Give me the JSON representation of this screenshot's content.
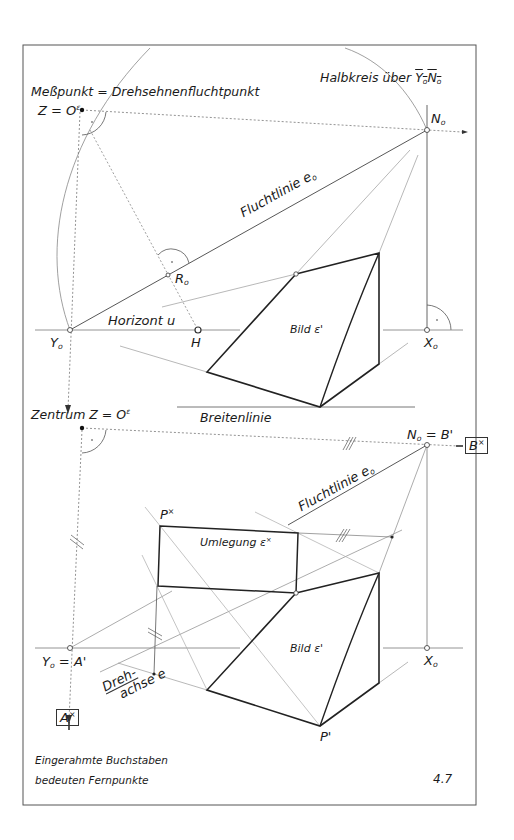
{
  "figure": {
    "number": "4.7",
    "caption_lines": [
      "Eingerahmte Buchstaben",
      "bedeuten Fernpunkte"
    ]
  },
  "top": {
    "title_left": "Meßpunkt = Drehsehnenfluchtpunkt",
    "title_right_prefix": "Halbkreis über ",
    "title_right_segment": "Y",
    "title_right_segment_sub": "o",
    "title_right_segment2": "N",
    "title_right_segment2_sub": "o",
    "z_label": "Z = O",
    "z_sup": "ε",
    "n0": "N",
    "n0_sub": "o",
    "fluchtlinie": "Fluchtlinie e",
    "fluchtlinie_sub": "o",
    "r0": "R",
    "r0_sub": "o",
    "horizont": "Horizont u",
    "h": "H",
    "y0": "Y",
    "y0_sub": "o",
    "x0": "X",
    "x0_sub": "o",
    "bild": "Bild ε'",
    "breitenlinie": "Breitenlinie"
  },
  "bottom": {
    "zentrum": "Zentrum  Z = O",
    "zentrum_sup": "ε",
    "n0": "N",
    "n0_sub": "o",
    "n0_eq": " = B'",
    "b_star": "B",
    "b_star_sup": "×",
    "fluchtlinie": "Fluchtlinie e",
    "fluchtlinie_sub": "o",
    "p_star": "P",
    "p_star_sup": "×",
    "umlegung": "Umlegung ε",
    "umlegung_sup": "×",
    "y0": "Y",
    "y0_sub": "o",
    "y0_eq": " = A'",
    "a_star": "A",
    "a_star_sup": "×",
    "dreh1": "Dreh-",
    "dreh2": "achse e",
    "bild": "Bild ε'",
    "x0": "X",
    "x0_sub": "o",
    "p_prime": "P'"
  }
}
